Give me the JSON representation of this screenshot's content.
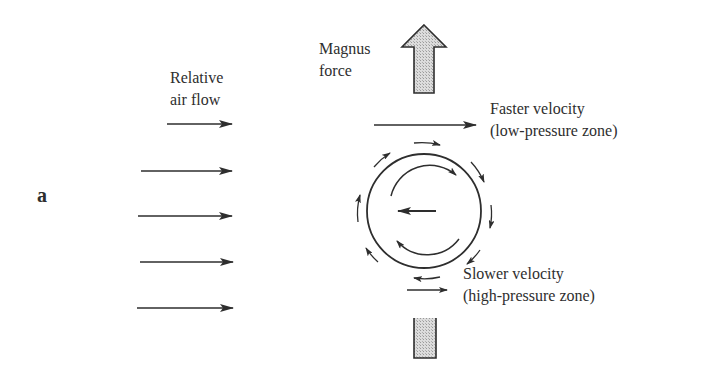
{
  "figure": {
    "panel_label": "a",
    "labels": {
      "relative_air_flow": [
        "Relative",
        "air flow"
      ],
      "magnus_force": [
        "Magnus",
        "force"
      ],
      "faster_velocity": [
        "Faster velocity",
        "(low-pressure zone)"
      ],
      "slower_velocity": [
        "Slower velocity",
        "(high-pressure zone)"
      ]
    },
    "colors": {
      "ink": "#2e2e2e",
      "arrow_fill": "#c8c8c8",
      "background": "#ffffff"
    },
    "air_flow_arrows": [
      {
        "x1": 167,
        "x2": 232,
        "y": 124
      },
      {
        "x1": 141,
        "x2": 232,
        "y": 171
      },
      {
        "x1": 138,
        "x2": 232,
        "y": 216
      },
      {
        "x1": 140,
        "x2": 233,
        "y": 262
      },
      {
        "x1": 137,
        "x2": 233,
        "y": 308
      }
    ],
    "ball": {
      "cx": 424,
      "cy": 211,
      "r": 57
    },
    "velocity_arrows": {
      "faster": {
        "x1": 374,
        "x2": 476,
        "y": 125
      },
      "slower": {
        "x1": 407,
        "x2": 447,
        "y": 290
      }
    },
    "magnus_arrow": {
      "tip_x": 424,
      "tip_y": 25,
      "head_left": 402,
      "head_right": 446,
      "head_base_y": 47,
      "shaft_left": 414,
      "shaft_right": 434,
      "shaft_bottom": 93
    },
    "lower_shaft": {
      "left": 414,
      "right": 436,
      "top": 318,
      "bottom": 358
    }
  }
}
